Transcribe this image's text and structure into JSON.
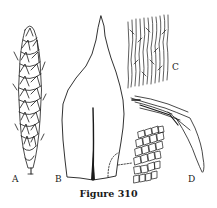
{
  "figure": {
    "caption": "Figure 310",
    "panels": [
      {
        "label": "A",
        "description": "shoot"
      },
      {
        "label": "B",
        "description": "leaf"
      },
      {
        "label": "C",
        "description": "upper leaf cells"
      },
      {
        "label": "D",
        "description": "alar cells / branch detail"
      }
    ]
  }
}
